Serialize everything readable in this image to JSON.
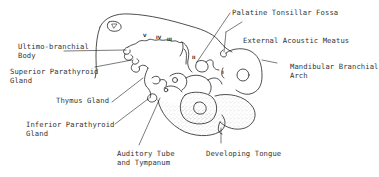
{
  "figure": {
    "type": "anatomical line drawing"
  },
  "labels": {
    "palatine_tonsillar_fossa": "Palatine Tonsillar Fossa",
    "external_acoustic_meatus": "External Acoustic Meatus",
    "ultimo_branchial_1": "Ultimo-branchial",
    "ultimo_branchial_2": "Body",
    "superior_parathyroid_1": "Superior Parathyroid",
    "superior_parathyroid_2": "Gland",
    "thymus_gland": "Thymus Gland",
    "inferior_parathyroid_1": "Inferior Parathyroid",
    "inferior_parathyroid_2": "Gland",
    "auditory_tube_1": "Auditory Tube",
    "auditory_tube_2": "and Tympanum",
    "developing_tongue": "Developing Tongue",
    "mandibular_arch_1": "Mandibular Branchial",
    "mandibular_arch_2": "Arch"
  },
  "arch_numerals": [
    "V",
    "IV",
    "III",
    "II",
    "I"
  ],
  "colors": {
    "line": "#222222",
    "text": "#333333",
    "stipple": "#9a9a9a",
    "background": "#ffffff"
  }
}
